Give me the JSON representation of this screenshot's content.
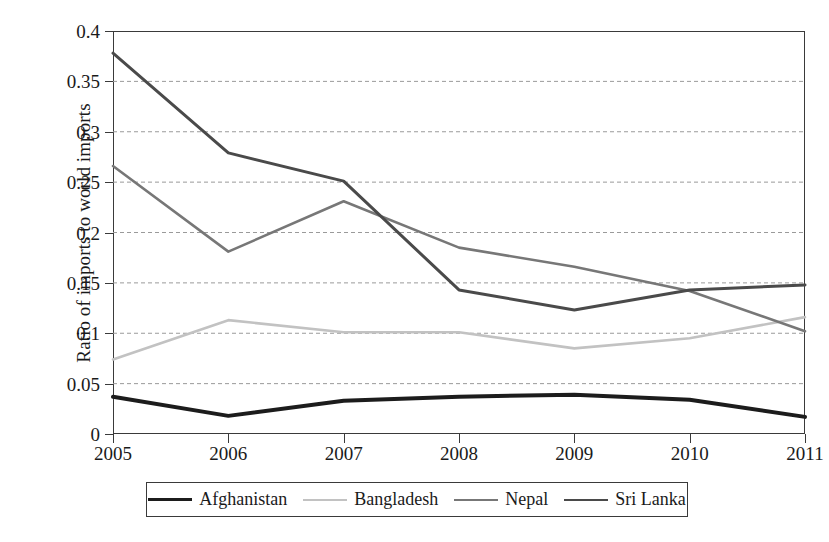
{
  "chart_data": {
    "type": "line",
    "title": "",
    "xlabel": "",
    "ylabel": "Ratio of imports to world imports",
    "x": [
      2005,
      2006,
      2007,
      2008,
      2009,
      2010,
      2011
    ],
    "xtick_labels": [
      "2005",
      "2006",
      "2007",
      "2008",
      "2009",
      "2010",
      "2011"
    ],
    "ytick_labels": [
      "0",
      "0.05",
      "0.1",
      "0.15",
      "0.2",
      "0.25",
      "0.3",
      "0.35",
      "0.4"
    ],
    "ytick_values": [
      0,
      0.05,
      0.1,
      0.15,
      0.2,
      0.25,
      0.3,
      0.35,
      0.4
    ],
    "ylim": [
      0,
      0.4
    ],
    "xlim": [
      2005,
      2011
    ],
    "grid": "horizontal-dashed",
    "legend_position": "below-boxed",
    "series": [
      {
        "name": "Afghanistan",
        "color": "#1c1c1c",
        "width": 4.0,
        "values": [
          0.037,
          0.018,
          0.033,
          0.037,
          0.039,
          0.034,
          0.017
        ]
      },
      {
        "name": "Bangladesh",
        "color": "#c2c2c2",
        "width": 2.6,
        "values": [
          0.074,
          0.113,
          0.101,
          0.101,
          0.085,
          0.095,
          0.116
        ]
      },
      {
        "name": "Nepal",
        "color": "#777777",
        "width": 2.6,
        "values": [
          0.266,
          0.181,
          0.231,
          0.185,
          0.166,
          0.142,
          0.102
        ]
      },
      {
        "name": "Sri Lanka",
        "color": "#4a4a4a",
        "width": 3.0,
        "values": [
          0.378,
          0.279,
          0.251,
          0.143,
          0.123,
          0.143,
          0.148
        ]
      }
    ]
  },
  "legend": {
    "items": [
      {
        "label": "Afghanistan"
      },
      {
        "label": "Bangladesh"
      },
      {
        "label": "Nepal"
      },
      {
        "label": "Sri Lanka"
      }
    ]
  }
}
